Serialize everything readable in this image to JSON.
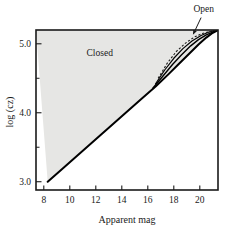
{
  "chart_data": {
    "type": "line",
    "title": "",
    "xlabel": "Apparent mag",
    "ylabel": "log (cz)",
    "xlim": [
      7.4,
      21.4
    ],
    "ylim": [
      2.88,
      5.2
    ],
    "grid": false,
    "legend_position": "none",
    "xticks": [
      8,
      10,
      12,
      14,
      16,
      18,
      20
    ],
    "xtick_labels": [
      "8",
      "10",
      "12",
      "14",
      "16",
      "18",
      "20"
    ],
    "yticks": [
      3.0,
      4.0,
      5.0
    ],
    "ytick_labels": [
      "3.0",
      "4.0",
      "5.0"
    ],
    "yticks_minor": [
      3.5,
      4.5
    ],
    "shaded_regions": [
      {
        "name": "closed-region",
        "label": "Closed",
        "fill": "#e6e6e4",
        "label_x": 12.3,
        "label_y": 4.82
      }
    ],
    "annotations": [
      {
        "name": "open-annotation",
        "label": "Open",
        "text_x": 20.3,
        "text_y": 5.46,
        "arrow_from_x": 20.1,
        "arrow_from_y": 5.38,
        "arrow_to_x": 19.5,
        "arrow_to_y": 5.14
      }
    ],
    "series": [
      {
        "name": "curve-solid-lower",
        "style": "solid",
        "color": "#000000",
        "width": 2.0,
        "x": [
          8.3,
          9.5,
          11.0,
          12.5,
          14.0,
          15.5,
          16.6,
          17.6,
          18.4,
          19.2,
          19.9,
          20.5,
          21.0,
          21.4
        ],
        "y": [
          3.0,
          3.2,
          3.45,
          3.7,
          3.95,
          4.2,
          4.38,
          4.56,
          4.71,
          4.86,
          4.99,
          5.09,
          5.16,
          5.2
        ]
      },
      {
        "name": "curve-solid-mid",
        "style": "solid",
        "color": "#000000",
        "width": 1.4,
        "x": [
          16.4,
          17.2,
          17.9,
          18.6,
          19.3,
          19.9,
          20.5,
          21.0,
          21.4
        ],
        "y": [
          4.36,
          4.54,
          4.7,
          4.84,
          4.97,
          5.06,
          5.13,
          5.17,
          5.2
        ]
      },
      {
        "name": "curve-solid-upper",
        "style": "solid",
        "color": "#000000",
        "width": 1.2,
        "x": [
          16.6,
          17.3,
          18.0,
          18.7,
          19.4,
          20.1,
          20.7,
          21.1,
          21.4
        ],
        "y": [
          4.42,
          4.62,
          4.79,
          4.93,
          5.04,
          5.12,
          5.17,
          5.19,
          5.2
        ]
      },
      {
        "name": "curve-dashed",
        "style": "dashed",
        "color": "#1a1a1a",
        "width": 1.1,
        "x": [
          16.8,
          17.5,
          18.2,
          18.9,
          19.6,
          20.2,
          20.8,
          21.2,
          21.4
        ],
        "y": [
          4.5,
          4.72,
          4.89,
          5.01,
          5.1,
          5.15,
          5.18,
          5.195,
          5.2
        ]
      }
    ]
  },
  "axes": {
    "y_axis_label": "log (cz)",
    "x_axis_label": "Apparent mag"
  },
  "labels": {
    "closed": "Closed",
    "open": "Open"
  }
}
